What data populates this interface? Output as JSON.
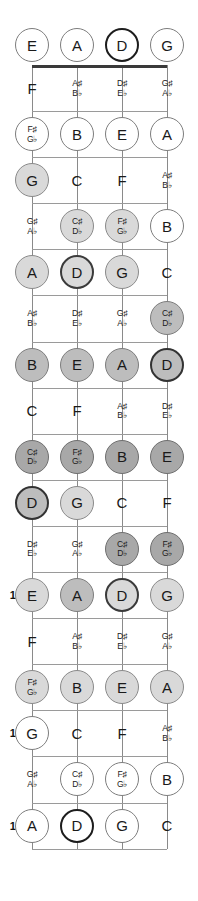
{
  "diagram": {
    "type": "bass-fretboard",
    "string_count": 4,
    "fret_count": 17,
    "orientation": "vertical",
    "open_string_labels": [
      "E",
      "A",
      "D",
      "G"
    ],
    "marked_fret_numbers": [
      "5",
      "7",
      "9",
      "12",
      "15",
      "17"
    ],
    "highlight_colors": {
      "white": "#ffffff",
      "light_gray": "#d9d9d9",
      "mid_gray": "#bdbdbd",
      "dark_gray": "#a8a8a8",
      "root_ring": "#1d1d1d",
      "nut": "#3a3a3a",
      "line": "#8a8a8a"
    },
    "frets": [
      {
        "number": "0",
        "label": "",
        "notes": [
          {
            "name": "E",
            "style": "white"
          },
          {
            "name": "A",
            "style": "white"
          },
          {
            "name": "D",
            "style": "rootw"
          },
          {
            "name": "G",
            "style": "white"
          }
        ]
      },
      {
        "number": "1",
        "label": "",
        "notes": [
          {
            "name": "F",
            "style": "none"
          },
          {
            "name": "A♯|B♭",
            "style": "none"
          },
          {
            "name": "D♯|E♭",
            "style": "none"
          },
          {
            "name": "G♯|A♭",
            "style": "none"
          }
        ]
      },
      {
        "number": "2",
        "label": "",
        "notes": [
          {
            "name": "F♯|G♭",
            "style": "white"
          },
          {
            "name": "B",
            "style": "white"
          },
          {
            "name": "E",
            "style": "white"
          },
          {
            "name": "A",
            "style": "white"
          }
        ]
      },
      {
        "number": "3",
        "label": "",
        "notes": [
          {
            "name": "G",
            "style": "light"
          },
          {
            "name": "C",
            "style": "none"
          },
          {
            "name": "F",
            "style": "none"
          },
          {
            "name": "A♯|B♭",
            "style": "none"
          }
        ]
      },
      {
        "number": "4",
        "label": "",
        "notes": [
          {
            "name": "G♯|A♭",
            "style": "none"
          },
          {
            "name": "C♯|D♭",
            "style": "light"
          },
          {
            "name": "F♯|G♭",
            "style": "light"
          },
          {
            "name": "B",
            "style": "white"
          }
        ]
      },
      {
        "number": "5",
        "label": "5",
        "notes": [
          {
            "name": "A",
            "style": "light"
          },
          {
            "name": "D",
            "style": "rootl"
          },
          {
            "name": "G",
            "style": "light"
          },
          {
            "name": "C",
            "style": "none"
          }
        ]
      },
      {
        "number": "6",
        "label": "",
        "notes": [
          {
            "name": "A♯|B♭",
            "style": "none"
          },
          {
            "name": "D♯|E♭",
            "style": "none"
          },
          {
            "name": "G♯|A♭",
            "style": "none"
          },
          {
            "name": "C♯|D♭",
            "style": "mid"
          }
        ]
      },
      {
        "number": "7",
        "label": "7",
        "notes": [
          {
            "name": "B",
            "style": "mid"
          },
          {
            "name": "E",
            "style": "mid"
          },
          {
            "name": "A",
            "style": "mid"
          },
          {
            "name": "D",
            "style": "rootm"
          }
        ]
      },
      {
        "number": "8",
        "label": "",
        "notes": [
          {
            "name": "C",
            "style": "none"
          },
          {
            "name": "F",
            "style": "none"
          },
          {
            "name": "A♯|B♭",
            "style": "none"
          },
          {
            "name": "D♯|E♭",
            "style": "none"
          }
        ]
      },
      {
        "number": "9",
        "label": "9",
        "notes": [
          {
            "name": "C♯|D♭",
            "style": "dark"
          },
          {
            "name": "F♯|G♭",
            "style": "dark"
          },
          {
            "name": "B",
            "style": "dark"
          },
          {
            "name": "E",
            "style": "dark"
          }
        ]
      },
      {
        "number": "10",
        "label": "",
        "notes": [
          {
            "name": "D",
            "style": "rootm"
          },
          {
            "name": "G",
            "style": "light"
          },
          {
            "name": "C",
            "style": "none"
          },
          {
            "name": "F",
            "style": "none"
          }
        ]
      },
      {
        "number": "11",
        "label": "",
        "notes": [
          {
            "name": "D♯|E♭",
            "style": "none"
          },
          {
            "name": "G♯|A♭",
            "style": "none"
          },
          {
            "name": "C♯|D♭",
            "style": "dark"
          },
          {
            "name": "F♯|G♭",
            "style": "dark"
          }
        ]
      },
      {
        "number": "12",
        "label": "12",
        "notes": [
          {
            "name": "E",
            "style": "light"
          },
          {
            "name": "A",
            "style": "mid"
          },
          {
            "name": "D",
            "style": "rootl"
          },
          {
            "name": "G",
            "style": "light"
          }
        ]
      },
      {
        "number": "13",
        "label": "",
        "notes": [
          {
            "name": "F",
            "style": "none"
          },
          {
            "name": "A♯|B♭",
            "style": "none"
          },
          {
            "name": "D♯|E♭",
            "style": "none"
          },
          {
            "name": "G♯|A♭",
            "style": "none"
          }
        ]
      },
      {
        "number": "14",
        "label": "",
        "notes": [
          {
            "name": "F♯|G♭",
            "style": "light"
          },
          {
            "name": "B",
            "style": "light"
          },
          {
            "name": "E",
            "style": "light"
          },
          {
            "name": "A",
            "style": "light"
          }
        ]
      },
      {
        "number": "15",
        "label": "15",
        "notes": [
          {
            "name": "G",
            "style": "white"
          },
          {
            "name": "C",
            "style": "none"
          },
          {
            "name": "F",
            "style": "none"
          },
          {
            "name": "A♯|B♭",
            "style": "none"
          }
        ]
      },
      {
        "number": "16",
        "label": "",
        "notes": [
          {
            "name": "G♯|A♭",
            "style": "none"
          },
          {
            "name": "C♯|D♭",
            "style": "white"
          },
          {
            "name": "F♯|G♭",
            "style": "white"
          },
          {
            "name": "B",
            "style": "white"
          }
        ]
      },
      {
        "number": "17",
        "label": "17",
        "notes": [
          {
            "name": "A",
            "style": "white"
          },
          {
            "name": "D",
            "style": "rootw"
          },
          {
            "name": "G",
            "style": "white"
          },
          {
            "name": "C",
            "style": "none"
          }
        ]
      }
    ]
  }
}
